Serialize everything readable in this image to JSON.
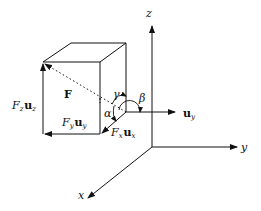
{
  "figure": {
    "type": "3d-vector-decomposition",
    "axes": {
      "x": {
        "label": "x"
      },
      "y": {
        "label": "y"
      },
      "z": {
        "label": "z"
      }
    },
    "vector": {
      "label": "F"
    },
    "components": {
      "x": {
        "coef": "F",
        "sub": "x",
        "unit": "u",
        "unit_sub": "x"
      },
      "y": {
        "coef": "F",
        "sub": "y",
        "unit": "u",
        "unit_sub": "y"
      },
      "z": {
        "coef": "F",
        "sub": "z",
        "unit": "u",
        "unit_sub": "z"
      }
    },
    "unit_vector": {
      "unit": "u",
      "sub": "y"
    },
    "angles": {
      "alpha": "α",
      "beta": "β",
      "gamma": "γ"
    },
    "colors": {
      "line": "#111111",
      "background": "#ffffff"
    }
  }
}
